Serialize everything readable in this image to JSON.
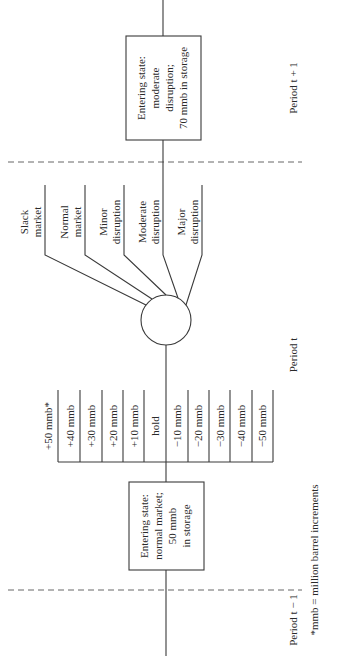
{
  "diagram": {
    "orientation": "rotated-90-ccw",
    "periods": {
      "prev": "Period t − 1",
      "current": "Period t",
      "next": "Period t + 1"
    },
    "entering_state_current": {
      "line1": "Entering state:",
      "line2": "normal market;",
      "line3": "50 mmb",
      "line4": "in storage"
    },
    "entering_state_next": {
      "line1": "Entering state:",
      "line2": "moderate",
      "line3": "disruption;",
      "line4": "70 mmb in storage"
    },
    "decisions": [
      "+50 mmb*",
      "+40 mmb",
      "+30 mmb",
      "+20 mmb",
      "+10 mmb",
      "hold",
      "−10 mmb",
      "−20 mmb",
      "−30 mmb",
      "−40 mmb",
      "−50 mmb"
    ],
    "outcomes": [
      {
        "line1": "Slack",
        "line2": "market"
      },
      {
        "line1": "Normal",
        "line2": "market"
      },
      {
        "line1": "Minor",
        "line2": "disruption"
      },
      {
        "line1": "Moderate",
        "line2": "disruption"
      },
      {
        "line1": "Major",
        "line2": "disruption"
      }
    ],
    "footnote": "*mmb = million barrel increments"
  }
}
